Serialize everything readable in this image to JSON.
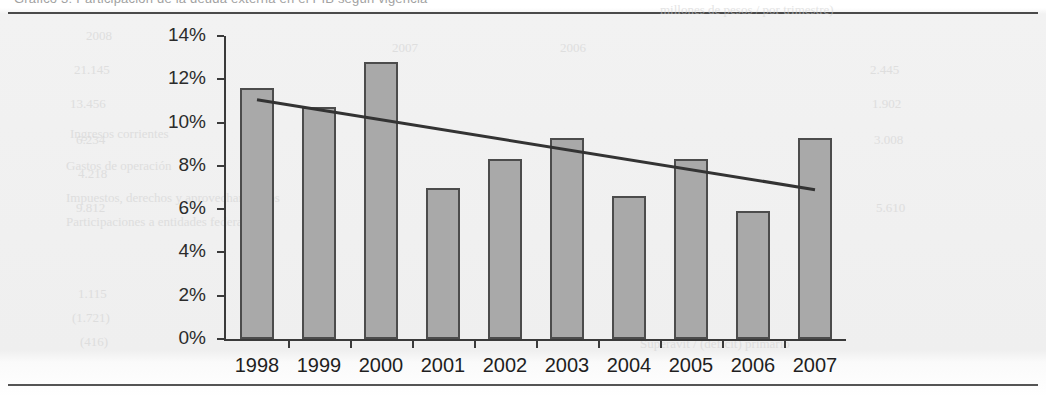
{
  "document": {
    "top_cropped_text": "Gráfico 3: Participación de la deuda externa en el PIB según vigencia",
    "ghost_texts": [
      {
        "text": "millones de pesos / por trimestre)",
        "x": 660,
        "y": 2
      },
      {
        "text": "2008",
        "x": 86,
        "y": 28
      },
      {
        "text": "2007",
        "x": 392,
        "y": 40
      },
      {
        "text": "2006",
        "x": 560,
        "y": 40
      },
      {
        "text": "21.145",
        "x": 74,
        "y": 62
      },
      {
        "text": "13.456",
        "x": 70,
        "y": 96
      },
      {
        "text": "Ingresos corrientes",
        "x": 70,
        "y": 126
      },
      {
        "text": "6.234",
        "x": 76,
        "y": 132
      },
      {
        "text": "Gastos de operación",
        "x": 66,
        "y": 158
      },
      {
        "text": "4.218",
        "x": 78,
        "y": 166
      },
      {
        "text": "Impuestos, derechos y aprovechamientos",
        "x": 66,
        "y": 190
      },
      {
        "text": "9.812",
        "x": 76,
        "y": 200
      },
      {
        "text": "Participaciones a entidades federativas",
        "x": 66,
        "y": 214
      },
      {
        "text": "1.115",
        "x": 78,
        "y": 286
      },
      {
        "text": "(1.721)",
        "x": 72,
        "y": 310
      },
      {
        "text": "(416)",
        "x": 80,
        "y": 334
      },
      {
        "text": "2.445",
        "x": 870,
        "y": 62
      },
      {
        "text": "1.902",
        "x": 872,
        "y": 96
      },
      {
        "text": "3.008",
        "x": 874,
        "y": 132
      },
      {
        "text": "5.610",
        "x": 876,
        "y": 200
      },
      {
        "text": "Superávit / (déficit) primario",
        "x": 640,
        "y": 336
      }
    ]
  },
  "chart_data": {
    "type": "bar",
    "title": "",
    "xlabel": "",
    "ylabel": "",
    "categories": [
      "1998",
      "1999",
      "2000",
      "2001",
      "2002",
      "2003",
      "2004",
      "2005",
      "2006",
      "2007"
    ],
    "values": [
      11.6,
      10.7,
      12.8,
      7.0,
      8.3,
      9.3,
      6.6,
      8.3,
      5.9,
      9.3
    ],
    "value_suffix": "%",
    "ylim": [
      0,
      14
    ],
    "ytick_values": [
      0,
      2,
      4,
      6,
      8,
      10,
      12,
      14
    ],
    "ytick_labels": [
      "0%",
      "2%",
      "4%",
      "6%",
      "8%",
      "10%",
      "12%",
      "14%"
    ],
    "grid": false,
    "legend": null,
    "series": [
      {
        "name": "Participación",
        "type": "bar",
        "values": [
          11.6,
          10.7,
          12.8,
          7.0,
          8.3,
          9.3,
          6.6,
          8.3,
          5.9,
          9.3
        ],
        "color": "#a9a9a9",
        "edge_color": "#4c4c4c"
      },
      {
        "name": "Línea de tendencia",
        "type": "trendline",
        "start": {
          "x_category": "1998",
          "value": 11.05
        },
        "end": {
          "x_category": "2007",
          "value": 6.9
        },
        "color": "#333333"
      }
    ],
    "trendline": {
      "start_value": 11.05,
      "end_value": 6.9,
      "color": "#333333",
      "width": 3
    }
  },
  "colors": {
    "bar_fill": "#a9a9a9",
    "bar_edge": "#4c4c4c",
    "axis": "#3a3a3a",
    "trendline": "#333333",
    "page_background": "#efefef",
    "rule": "#4a4a4a",
    "tick_label": "#1f1f1f"
  }
}
